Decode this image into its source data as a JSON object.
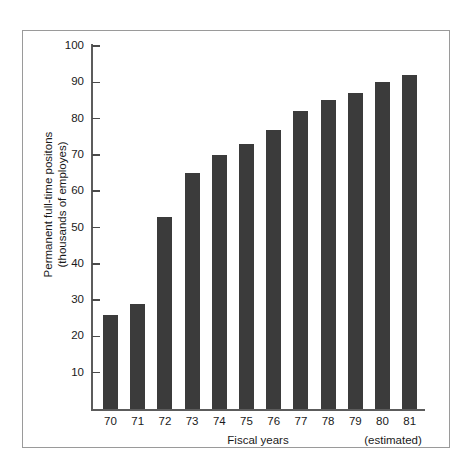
{
  "chart_data": {
    "type": "bar",
    "title": "",
    "subtitle": "",
    "xlabel": "Fiscal years",
    "ylabel_line1": "Permanent full-time positons",
    "ylabel_line2": "(thousands of employes)",
    "categories": [
      "70",
      "71",
      "72",
      "73",
      "74",
      "75",
      "76",
      "77",
      "78",
      "79",
      "80",
      "81"
    ],
    "values": [
      26,
      29,
      53,
      65,
      70,
      73,
      77,
      82,
      85,
      87,
      90,
      92
    ],
    "ylim": [
      0,
      100
    ],
    "ytick_values": [
      10,
      20,
      30,
      40,
      50,
      60,
      70,
      80,
      90,
      100
    ],
    "ytick_labels": [
      "10",
      "20",
      "30",
      "40",
      "50",
      "60",
      "70",
      "80",
      "90",
      "100"
    ],
    "grid": false,
    "legend": null,
    "annotations": [
      {
        "text": "(estimated)",
        "applies_to": [
          "80",
          "81"
        ],
        "position": "below-x-axis-right"
      }
    ],
    "bar_color": "#3b3b3b",
    "axis_color": "#5c5c5c",
    "background_color": "#ffffff",
    "frame_color": "#9a9a9a"
  },
  "annotations": {
    "estimated_note": "(estimated)"
  }
}
